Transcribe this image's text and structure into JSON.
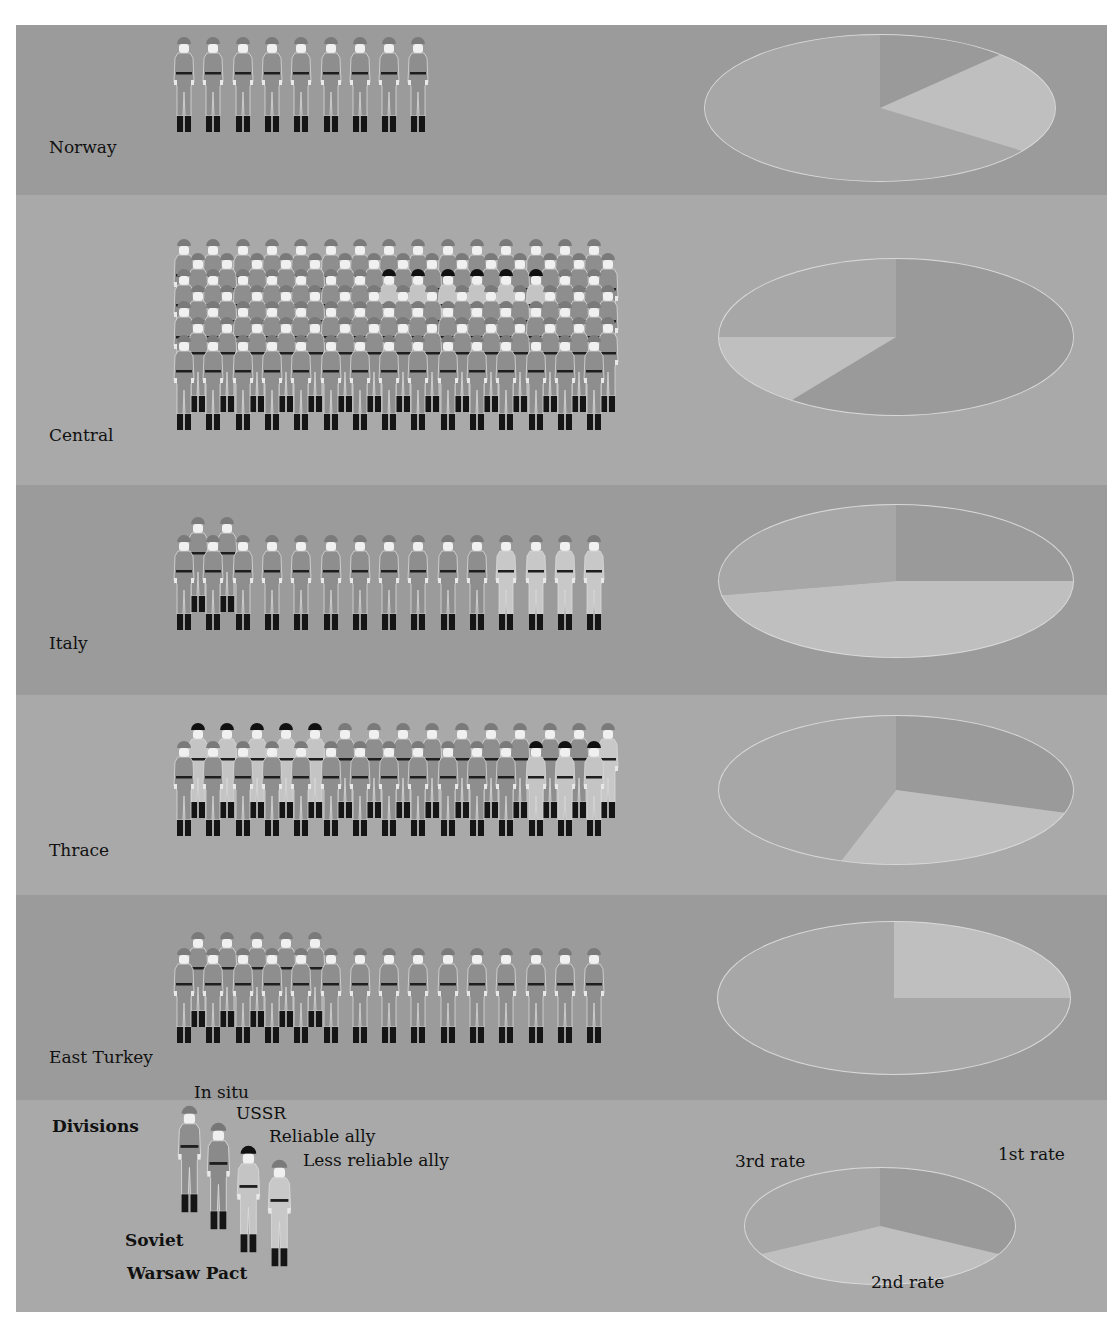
{
  "colors": {
    "panel_bg": "#a3a3a3",
    "band_dark": "#9b9b9b",
    "band_light": "#a9a9a9",
    "in_situ_body": "#8e8e8e",
    "in_situ_helmet": "#7a7a7a",
    "ussr_body": "#8a8a8a",
    "ussr_helmet": "#777777",
    "reliable_body": "#c4c4c4",
    "reliable_helmet": "#111111",
    "less_reliable_body": "#c8c8c8",
    "less_reliable_helmet": "#7a7a7a",
    "boots": "#151515",
    "belt": "#1e1e1e",
    "face": "#f0f0f0",
    "rate1": "#9a9a9a",
    "rate2": "#bfbfbf",
    "rate3": "#a7a7a7",
    "pie_rim": "#d8d8d8"
  },
  "regions": [
    {
      "name": "Norway",
      "band": "dark",
      "top": 0,
      "height": 170,
      "label_y": 112,
      "formation_y": 30,
      "rows": [
        {
          "offset_x": 0,
          "dy": 0,
          "units": [
            "S",
            "S",
            "S",
            "S",
            "S",
            "S",
            "S",
            "S",
            "S"
          ]
        }
      ],
      "pie": {
        "cx": 880,
        "cy": 83,
        "rx": 175,
        "ry": 73,
        "slices": {
          "rate1": 12,
          "rate2": 23,
          "rate3": 65
        }
      }
    },
    {
      "name": "Central",
      "band": "light",
      "top": 170,
      "height": 290,
      "label_y": 400,
      "formation_y": 232,
      "rows": [
        {
          "offset_x": 0,
          "dy": 0,
          "units": [
            "S",
            "S",
            "S",
            "S",
            "S",
            "S",
            "S",
            "S",
            "S",
            "S",
            "S",
            "S",
            "S",
            "S",
            "S"
          ]
        },
        {
          "offset_x": 14,
          "dy": 14,
          "units": [
            "S",
            "S",
            "S",
            "S",
            "S",
            "S",
            "S",
            "S",
            "S",
            "S",
            "S",
            "S",
            "S",
            "S",
            "S"
          ]
        },
        {
          "offset_x": 0,
          "dy": 30,
          "units": [
            "S",
            "S",
            "S",
            "S",
            "S",
            "S",
            "S",
            "R",
            "R",
            "R",
            "R",
            "R",
            "R",
            "S",
            "S"
          ]
        },
        {
          "offset_x": 14,
          "dy": 46,
          "units": [
            "S",
            "S",
            "S",
            "S",
            "S",
            "S",
            "S",
            "S",
            "S",
            "S",
            "S",
            "S",
            "S",
            "S",
            "S"
          ]
        },
        {
          "offset_x": 0,
          "dy": 62,
          "units": [
            "S",
            "S",
            "S",
            "S",
            "S",
            "S",
            "S",
            "S",
            "S",
            "S",
            "S",
            "S",
            "S",
            "S",
            "S"
          ]
        },
        {
          "offset_x": 14,
          "dy": 78,
          "units": [
            "S",
            "S",
            "S",
            "S",
            "S",
            "S",
            "S",
            "S",
            "S",
            "S",
            "S",
            "S",
            "S",
            "S",
            "S"
          ]
        },
        {
          "offset_x": 0,
          "dy": 96,
          "units": [
            "S",
            "S",
            "S",
            "S",
            "S",
            "S",
            "S",
            "S",
            "S",
            "S",
            "S",
            "S",
            "S",
            "S",
            "S"
          ]
        }
      ],
      "pie": {
        "cx": 896,
        "cy": 312,
        "rx": 177,
        "ry": 78,
        "slices": {
          "rate1": 60,
          "rate2": 15,
          "rate3": 25
        }
      }
    },
    {
      "name": "Italy",
      "band": "dark",
      "top": 460,
      "height": 210,
      "label_y": 608,
      "formation_y": 510,
      "rows": [
        {
          "offset_x": 14,
          "dy": 0,
          "units": [
            "S",
            "S"
          ]
        },
        {
          "offset_x": 0,
          "dy": 18,
          "units": [
            "S",
            "S",
            "S",
            "S",
            "S",
            "S",
            "S",
            "S",
            "S",
            "S",
            "S",
            "L",
            "L",
            "L",
            "L"
          ]
        }
      ],
      "pie": {
        "cx": 896,
        "cy": 556,
        "rx": 177,
        "ry": 76,
        "slices": {
          "rate1": 25,
          "rate2": 47,
          "rate3": 28
        }
      }
    },
    {
      "name": "Thrace",
      "band": "light",
      "top": 670,
      "height": 200,
      "label_y": 815,
      "formation_y": 716,
      "rows": [
        {
          "offset_x": 14,
          "dy": 0,
          "units": [
            "R",
            "R",
            "R",
            "R",
            "R",
            "S",
            "S",
            "S",
            "S",
            "S",
            "S",
            "S",
            "S",
            "S",
            "L"
          ]
        },
        {
          "offset_x": 0,
          "dy": 18,
          "units": [
            "S",
            "S",
            "S",
            "S",
            "S",
            "S",
            "S",
            "S",
            "S",
            "S",
            "S",
            "S",
            "R",
            "R",
            "R"
          ]
        }
      ],
      "pie": {
        "cx": 896,
        "cy": 765,
        "rx": 177,
        "ry": 74,
        "slices": {
          "rate1": 30,
          "rate2": 25,
          "rate3": 45
        }
      }
    },
    {
      "name": "East Turkey",
      "band": "dark",
      "top": 870,
      "height": 205,
      "label_y": 1022,
      "formation_y": 925,
      "rows": [
        {
          "offset_x": 14,
          "dy": 0,
          "units": [
            "S",
            "S",
            "S",
            "S",
            "S"
          ]
        },
        {
          "offset_x": 0,
          "dy": 16,
          "units": [
            "S",
            "S",
            "S",
            "S",
            "S",
            "S",
            "S",
            "S",
            "S",
            "S",
            "S",
            "S",
            "S",
            "S",
            "S"
          ]
        }
      ],
      "pie": {
        "cx": 894,
        "cy": 973,
        "rx": 176,
        "ry": 76,
        "slices": {
          "rate1": 0,
          "rate2": 25,
          "rate3": 75
        }
      }
    }
  ],
  "legend": {
    "band": "light",
    "top": 1075,
    "height": 212,
    "title": "Divisions",
    "items": [
      {
        "key": "S",
        "label": "In situ",
        "x": 176,
        "y": 1098,
        "label_x": 178,
        "label_y": 1082
      },
      {
        "key": "U",
        "label": "USSR",
        "x": 205,
        "y": 1115,
        "label_x": 220,
        "label_y": 1103
      },
      {
        "key": "R",
        "label": "Reliable ally",
        "x": 235,
        "y": 1138,
        "label_x": 253,
        "label_y": 1126
      },
      {
        "key": "L",
        "label": "Less reliable ally",
        "x": 266,
        "y": 1152,
        "label_x": 287,
        "label_y": 1150
      }
    ],
    "group_labels": [
      {
        "label": "Soviet",
        "x": 109,
        "y": 1205
      },
      {
        "label": "Warsaw Pact",
        "x": 111,
        "y": 1238
      }
    ],
    "pie": {
      "cx": 880,
      "cy": 1176,
      "rx": 135,
      "ry": 58,
      "slices": {
        "rate1": 33,
        "rate2": 34,
        "rate3": 33
      }
    },
    "pie_labels": [
      {
        "key": "rate1",
        "label": "1st rate",
        "x": 982,
        "y": 1119
      },
      {
        "key": "rate3",
        "label": "3rd rate",
        "x": 719,
        "y": 1126
      },
      {
        "key": "rate2",
        "label": "2nd rate",
        "x": 855,
        "y": 1247
      }
    ]
  },
  "chart_data": {
    "type": "pictogram+pie",
    "title": "",
    "categories": [
      "Norway",
      "Central",
      "Italy",
      "Thrace",
      "East Turkey"
    ],
    "division_legend": {
      "Soviet": [
        "In situ",
        "USSR"
      ],
      "Warsaw Pact": [
        "Reliable ally",
        "Less reliable ally"
      ]
    },
    "series": [
      {
        "name": "Soviet (in situ/USSR) divisions",
        "values": [
          9,
          99,
          13,
          22,
          20
        ]
      },
      {
        "name": "Reliable ally divisions",
        "values": [
          0,
          6,
          0,
          8,
          0
        ]
      },
      {
        "name": "Less reliable ally divisions",
        "values": [
          0,
          0,
          4,
          1,
          0
        ]
      }
    ],
    "totals": [
      9,
      105,
      17,
      31,
      20
    ],
    "readiness_pies": {
      "legend": [
        "1st rate",
        "2nd rate",
        "3rd rate"
      ],
      "Norway": {
        "1st rate": 12,
        "2nd rate": 23,
        "3rd rate": 65
      },
      "Central": {
        "1st rate": 60,
        "2nd rate": 15,
        "3rd rate": 25
      },
      "Italy": {
        "1st rate": 25,
        "2nd rate": 47,
        "3rd rate": 28
      },
      "Thrace": {
        "1st rate": 30,
        "2nd rate": 25,
        "3rd rate": 45
      },
      "East Turkey": {
        "1st rate": 0,
        "2nd rate": 25,
        "3rd rate": 75
      }
    },
    "units": "percent of divisions (estimated from pie angles)",
    "grid": false,
    "legend_position": "bottom"
  }
}
